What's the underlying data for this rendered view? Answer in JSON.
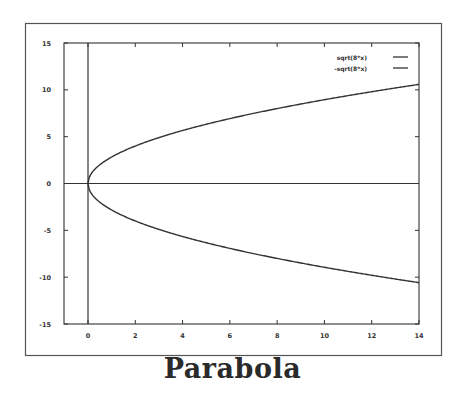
{
  "chart_data": {
    "type": "line",
    "title": "Parabola",
    "xlabel": "",
    "ylabel": "",
    "xlim": [
      -1,
      14
    ],
    "ylim": [
      -15,
      15
    ],
    "x_ticks": [
      0,
      2,
      4,
      6,
      8,
      10,
      12,
      14
    ],
    "y_ticks": [
      15,
      10,
      5,
      0,
      -5,
      -10,
      -15
    ],
    "grid": false,
    "legend_position": "top-right",
    "zero_axes": true,
    "series": [
      {
        "name": "sqrt(8*x)",
        "x": [
          0,
          0.25,
          0.5,
          1,
          2,
          3,
          4,
          5,
          6,
          7,
          8,
          9,
          10,
          11,
          12,
          13,
          14
        ],
        "values": [
          0,
          1.41,
          2.0,
          2.83,
          4.0,
          4.9,
          5.66,
          6.32,
          6.93,
          7.48,
          8.0,
          8.49,
          8.94,
          9.38,
          9.8,
          10.2,
          10.58
        ]
      },
      {
        "name": "-sqrt(8*x)",
        "x": [
          0,
          0.25,
          0.5,
          1,
          2,
          3,
          4,
          5,
          6,
          7,
          8,
          9,
          10,
          11,
          12,
          13,
          14
        ],
        "values": [
          0,
          -1.41,
          -2.0,
          -2.83,
          -4.0,
          -4.9,
          -5.66,
          -6.32,
          -6.93,
          -7.48,
          -8.0,
          -8.49,
          -8.94,
          -9.38,
          -9.8,
          -10.2,
          -10.58
        ]
      }
    ]
  },
  "colors": {
    "line": "#333333",
    "frame": "#444444",
    "background": "#ffffff"
  }
}
